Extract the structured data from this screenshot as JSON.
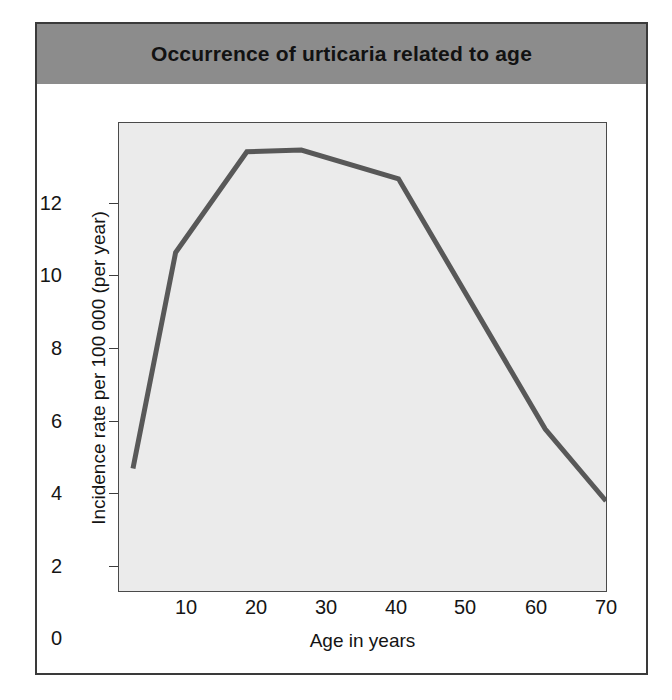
{
  "figure": {
    "title": "Occurrence of urticaria related to age",
    "title_band_color": "#8c8c8c",
    "border_color": "#3a3a3a"
  },
  "chart_data": {
    "type": "line",
    "title": "Occurrence of urticaria related to age",
    "xlabel": "Age in years",
    "ylabel": "Incidence rate per 100 000 (per year)",
    "xlim": [
      0.3,
      70
    ],
    "ylim": [
      0,
      13
    ],
    "grid": false,
    "legend": null,
    "line_color": "#585858",
    "plot_background": "#ebebeb",
    "x_ticks": [
      10,
      20,
      30,
      40,
      50,
      60,
      70
    ],
    "y_ticks": [
      0,
      2,
      4,
      6,
      8,
      10,
      12
    ],
    "x": [
      2.3,
      8.4,
      18.6,
      26.4,
      40.3,
      61.3,
      70
    ],
    "values": [
      3.4,
      9.4,
      12.2,
      12.25,
      11.45,
      4.5,
      2.5
    ],
    "points": [
      {
        "age": 2.3,
        "rate": 3.4
      },
      {
        "age": 8.4,
        "rate": 9.4
      },
      {
        "age": 18.6,
        "rate": 12.2
      },
      {
        "age": 26.4,
        "rate": 12.25
      },
      {
        "age": 40.3,
        "rate": 11.45
      },
      {
        "age": 61.3,
        "rate": 4.5
      },
      {
        "age": 70,
        "rate": 2.5
      }
    ]
  },
  "axes": {
    "y_tick_labels": [
      "12",
      "10",
      "8",
      "6",
      "4",
      "2",
      "0"
    ],
    "x_tick_labels": [
      "10",
      "20",
      "30",
      "40",
      "50",
      "60",
      "70"
    ],
    "y_title": "Incidence rate per 100 000 (per year)",
    "x_title": "Age in years"
  }
}
